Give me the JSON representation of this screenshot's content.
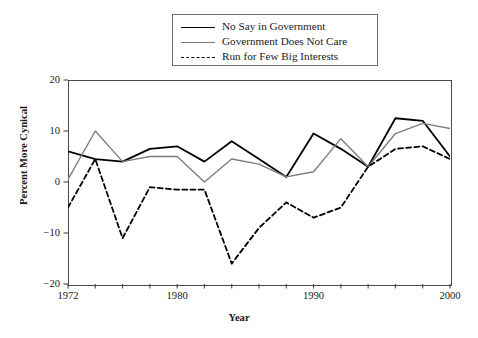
{
  "chart_data": {
    "type": "line",
    "title": "",
    "xlabel": "Year",
    "ylabel": "Percent More Cynical",
    "xlim": [
      1972,
      2000
    ],
    "ylim": [
      -20,
      20
    ],
    "grid": false,
    "legend_position": "top-center",
    "x": [
      1972,
      1974,
      1976,
      1978,
      1980,
      1982,
      1984,
      1986,
      1988,
      1990,
      1992,
      1994,
      1996,
      1998,
      2000
    ],
    "xticks": [
      1972,
      1974,
      1976,
      1978,
      1980,
      1982,
      1984,
      1986,
      1988,
      1990,
      1992,
      1994,
      1996,
      1998,
      2000
    ],
    "xtick_labels": [
      {
        "value": 1972,
        "label": "1972"
      },
      {
        "value": 1980,
        "label": "1980"
      },
      {
        "value": 1990,
        "label": "1990"
      },
      {
        "value": 2000,
        "label": "2000"
      }
    ],
    "yticks": [
      20,
      10,
      0,
      -10,
      -20
    ],
    "ytick_labels": [
      "20",
      "10",
      "0",
      "−10",
      "−20"
    ],
    "series": [
      {
        "name": "No Say in Government",
        "style": "solid",
        "color": "#000000",
        "width": 1.8,
        "values": [
          6.0,
          4.5,
          4.0,
          6.5,
          7.0,
          4.0,
          8.0,
          4.5,
          1.0,
          9.5,
          6.5,
          3.0,
          12.5,
          12.0,
          5.0
        ]
      },
      {
        "name": "Government Does Not Care",
        "style": "solid",
        "color": "#7d7d7d",
        "width": 1.4,
        "values": [
          0.5,
          10.0,
          4.0,
          5.0,
          5.0,
          0.0,
          4.5,
          3.5,
          1.0,
          2.0,
          8.5,
          3.0,
          9.5,
          11.5,
          10.5
        ]
      },
      {
        "name": "Run for Few Big Interests",
        "style": "dashed",
        "color": "#000000",
        "width": 1.8,
        "values": [
          -5.0,
          4.5,
          -11.0,
          -1.0,
          -1.5,
          -1.5,
          -16.0,
          -9.0,
          -4.0,
          -7.0,
          -5.0,
          3.0,
          6.5,
          7.0,
          4.5
        ]
      }
    ]
  },
  "legend": {
    "items": [
      {
        "label": "No Say in Government",
        "key": "solid-black-line-key"
      },
      {
        "label": "Government Does Not Care",
        "key": "solid-gray-line-key"
      },
      {
        "label": "Run for Few Big Interests",
        "key": "dashed-black-line-key"
      }
    ]
  }
}
